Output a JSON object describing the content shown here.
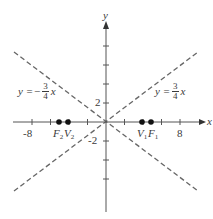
{
  "diagram": {
    "type": "hyperbola-asymptotes",
    "axes": {
      "x_label": "x",
      "y_label": "y",
      "x_ticks": [
        "-8",
        "8"
      ],
      "y_ticks": [
        "2",
        "-2"
      ],
      "tick_spacing_units": 2
    },
    "asymptotes": [
      {
        "label_lhs": "y =",
        "sign": "",
        "numerator": "3",
        "denominator": "4",
        "var": "x",
        "slope": 0.75,
        "style": "dashed"
      },
      {
        "label_lhs": "y =",
        "sign": "−",
        "numerator": "3",
        "denominator": "4",
        "var": "x",
        "slope": -0.75,
        "style": "dashed"
      }
    ],
    "points": [
      {
        "name": "F",
        "sub": "2",
        "x": -5,
        "y": 0
      },
      {
        "name": "V",
        "sub": "2",
        "x": -4,
        "y": 0
      },
      {
        "name": "V",
        "sub": "1",
        "x": 4,
        "y": 0
      },
      {
        "name": "F",
        "sub": "1",
        "x": 5,
        "y": 0
      }
    ],
    "colors": {
      "axis": "#555555",
      "asymptote": "#666666",
      "point": "#111111",
      "text": "#3a3a3a"
    }
  }
}
